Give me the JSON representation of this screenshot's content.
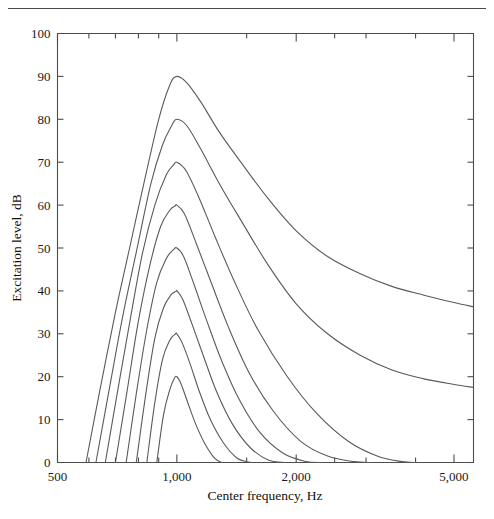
{
  "page": {
    "running_head": ""
  },
  "chart_data": {
    "type": "line",
    "title": "",
    "xlabel": "Center frequency, Hz",
    "ylabel": "Excitation level, dB",
    "xscale": "log",
    "yscale": "linear",
    "xlim": [
      500,
      5600
    ],
    "ylim": [
      0,
      100
    ],
    "grid": false,
    "legend": "none",
    "x_major_ticks": [
      500,
      1000,
      2000,
      5000
    ],
    "x_major_tick_labels": [
      "500",
      "1,000",
      "2,000",
      "5,000"
    ],
    "x_minor_ticks": [
      600,
      700,
      800,
      900,
      1500,
      2500,
      3000,
      4000
    ],
    "y_ticks": [
      0,
      10,
      20,
      30,
      40,
      50,
      60,
      70,
      80,
      90,
      100
    ],
    "y_tick_labels": [
      "0",
      "10",
      "20",
      "30",
      "40",
      "50",
      "60",
      "70",
      "80",
      "90",
      "100"
    ],
    "peak_frequency_hz": 1000,
    "series": [
      {
        "name": "90 dB excitation pattern",
        "peak_level_db": 90,
        "low_cut_hz": 590,
        "high_tail_end_db": 36.5,
        "x": [
          590,
          640,
          700,
          760,
          830,
          900,
          960,
          1000,
          1060,
          1150,
          1280,
          1450,
          1700,
          2000,
          2400,
          2900,
          3500,
          4200,
          5000,
          5600
        ],
        "y": [
          0,
          17,
          35,
          50,
          66,
          80,
          88,
          90,
          88.5,
          84,
          77,
          70,
          61.5,
          54,
          48,
          44,
          41,
          39,
          37.3,
          36.3
        ]
      },
      {
        "name": "80 dB excitation pattern",
        "peak_level_db": 80,
        "low_cut_hz": 625,
        "high_tail_end_db": 17.5,
        "x": [
          625,
          675,
          730,
          790,
          860,
          920,
          970,
          1000,
          1060,
          1150,
          1280,
          1450,
          1700,
          2000,
          2400,
          2900,
          3500,
          4200,
          5000,
          5600
        ],
        "y": [
          0,
          17,
          34,
          49,
          65,
          74,
          78.5,
          80,
          78.5,
          73,
          65,
          56.5,
          46,
          37,
          30,
          25,
          21.5,
          19.5,
          18.2,
          17.5
        ]
      },
      {
        "name": "70 dB excitation pattern",
        "peak_level_db": 70,
        "low_cut_hz": 660,
        "high_tail_end_db": 0,
        "x": [
          660,
          710,
          765,
          820,
          880,
          940,
          980,
          1000,
          1055,
          1140,
          1250,
          1400,
          1600,
          1900,
          2250,
          2700,
          3200,
          3700,
          4000
        ],
        "y": [
          0,
          17,
          34,
          49,
          60,
          67,
          69.3,
          70,
          68,
          61.5,
          52.5,
          42,
          31,
          20,
          11.5,
          5,
          1.5,
          0.2,
          0
        ]
      },
      {
        "name": "60 dB excitation pattern",
        "peak_level_db": 60,
        "low_cut_hz": 700,
        "high_tail_end_db": 0,
        "x": [
          700,
          750,
          800,
          855,
          910,
          960,
          990,
          1000,
          1045,
          1120,
          1220,
          1350,
          1520,
          1750,
          2050,
          2400,
          2800,
          3100
        ],
        "y": [
          0,
          17,
          33,
          46,
          55,
          58.8,
          59.8,
          60,
          58,
          51,
          42,
          31.5,
          21,
          12,
          5,
          1.5,
          0.2,
          0
        ]
      },
      {
        "name": "50 dB excitation pattern",
        "peak_level_db": 50,
        "low_cut_hz": 745,
        "high_tail_end_db": 0,
        "x": [
          745,
          790,
          840,
          890,
          940,
          980,
          1000,
          1040,
          1105,
          1190,
          1300,
          1440,
          1620,
          1850,
          2100,
          2350
        ],
        "y": [
          0,
          16,
          31,
          42,
          47.5,
          49.6,
          50,
          48,
          41.5,
          33,
          23.5,
          14.5,
          7,
          2.2,
          0.3,
          0
        ]
      },
      {
        "name": "40 dB excitation pattern",
        "peak_level_db": 40,
        "low_cut_hz": 790,
        "high_tail_end_db": 0,
        "x": [
          790,
          835,
          880,
          925,
          965,
          995,
          1000,
          1035,
          1090,
          1165,
          1260,
          1380,
          1530,
          1700,
          1880
        ],
        "y": [
          0,
          16,
          29,
          36,
          39,
          39.9,
          40,
          38,
          32.5,
          25,
          16.5,
          9,
          3.5,
          0.6,
          0
        ]
      },
      {
        "name": "30 dB excitation pattern",
        "peak_level_db": 30,
        "low_cut_hz": 840,
        "high_tail_end_db": 0,
        "x": [
          840,
          880,
          920,
          960,
          990,
          1000,
          1030,
          1080,
          1140,
          1215,
          1310,
          1420,
          1540
        ],
        "y": [
          0,
          14,
          24,
          28.5,
          29.9,
          30,
          28,
          23,
          16.5,
          10,
          4.6,
          1,
          0
        ]
      },
      {
        "name": "20 dB excitation pattern",
        "peak_level_db": 20,
        "low_cut_hz": 890,
        "high_tail_end_db": 0,
        "x": [
          890,
          925,
          960,
          985,
          1000,
          1025,
          1065,
          1115,
          1175,
          1245,
          1300
        ],
        "y": [
          0,
          11,
          17,
          19.6,
          20,
          18.3,
          14,
          9,
          4.5,
          1,
          0
        ]
      }
    ]
  }
}
